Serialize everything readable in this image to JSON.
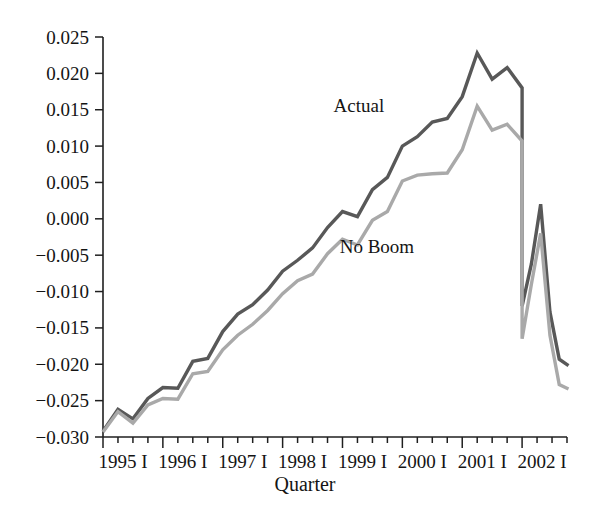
{
  "chart_data": {
    "type": "line",
    "title": "",
    "xlabel": "Quarter",
    "ylabel": "",
    "grid": false,
    "legend_position": "inline-annotation",
    "xlim": [
      0,
      31
    ],
    "ylim": [
      -0.03,
      0.025
    ],
    "y_ticks": [
      0.025,
      0.02,
      0.015,
      0.01,
      0.005,
      0.0,
      -0.005,
      -0.01,
      -0.015,
      -0.02,
      -0.025,
      -0.03
    ],
    "y_tick_labels": [
      "0.025",
      "0.020",
      "0.015",
      "0.010",
      "0.005",
      "0.000",
      "−0.005",
      "−0.010",
      "−0.015",
      "−0.020",
      "−0.025",
      "−0.030"
    ],
    "x_tick_labels": [
      "1995 I",
      "1996 I",
      "1997 I",
      "1998 I",
      "1999 I",
      "2000 I",
      "2001 I",
      "2002 I"
    ],
    "x_major_tick_indices": [
      0,
      4,
      8,
      12,
      16,
      20,
      24,
      28
    ],
    "x_minor_ticks_per_year": 4,
    "quarters": [
      "1995 I",
      "1995 II",
      "1995 III",
      "1995 IV",
      "1996 I",
      "1996 II",
      "1996 III",
      "1996 IV",
      "1997 I",
      "1997 II",
      "1997 III",
      "1997 IV",
      "1998 I",
      "1998 II",
      "1998 III",
      "1998 IV",
      "1999 I",
      "1999 II",
      "1999 III",
      "1999 IV",
      "2000 I",
      "2000 II",
      "2000 III",
      "2000 IV",
      "2001 I",
      "2001 II",
      "2001 III",
      "2001 IV",
      "2002 I",
      "2002 II",
      "2002 III"
    ],
    "series": [
      {
        "name": "Actual",
        "color": "#585858",
        "label_x_index": 17.1,
        "label_y_value": 0.0147,
        "values": [
          -0.0292,
          -0.0262,
          -0.0275,
          -0.0247,
          -0.0232,
          -0.0233,
          -0.0196,
          -0.0192,
          -0.0155,
          -0.0131,
          -0.0118,
          -0.0098,
          -0.0072,
          -0.0057,
          -0.004,
          -0.0012,
          0.001,
          0.0003,
          0.004,
          0.0057,
          0.01,
          0.0113,
          0.0133,
          0.0138,
          0.0168,
          0.0228,
          0.0192,
          0.0208,
          0.018,
          0.006,
          -0.012
        ]
      },
      {
        "name": "No Boom",
        "color": "#a9a9a9",
        "label_x_index": 18.3,
        "label_y_value": -0.0047,
        "values": [
          -0.0293,
          -0.0265,
          -0.0281,
          -0.0256,
          -0.0247,
          -0.0248,
          -0.0213,
          -0.021,
          -0.018,
          -0.016,
          -0.0145,
          -0.0126,
          -0.0103,
          -0.0085,
          -0.0076,
          -0.0048,
          -0.0028,
          -0.0036,
          -0.0002,
          0.001,
          0.0052,
          0.006,
          0.0062,
          0.0063,
          0.0095,
          0.0155,
          0.0122,
          0.013,
          0.0107,
          0.0,
          -0.0165
        ]
      }
    ],
    "tail_segments": {
      "note": "Sharp 2001-2002 decline, V-shaped rebound, then final drop",
      "actual_tail": [
        {
          "quarter": "2002 I",
          "value": -0.012
        },
        {
          "quarter": "2002 I+",
          "value": -0.0062
        },
        {
          "quarter": "2002 II",
          "value": 0.002
        },
        {
          "quarter": "2002 II+",
          "value": -0.0128
        },
        {
          "quarter": "2002 III",
          "value": -0.0193
        },
        {
          "quarter": "2002 III+",
          "value": -0.0202
        }
      ],
      "noboom_tail": [
        {
          "quarter": "2002 I",
          "value": -0.0165
        },
        {
          "quarter": "2002 I+",
          "value": -0.009
        },
        {
          "quarter": "2002 II",
          "value": -0.002
        },
        {
          "quarter": "2002 II+",
          "value": -0.016
        },
        {
          "quarter": "2002 III",
          "value": -0.0228
        },
        {
          "quarter": "2002 III+",
          "value": -0.0234
        }
      ]
    }
  }
}
